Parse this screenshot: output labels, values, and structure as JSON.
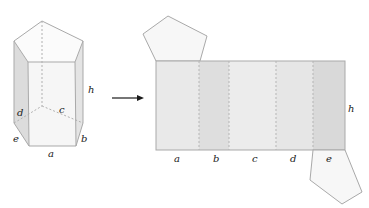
{
  "diagram": {
    "colors": {
      "edge": "#a9a9a9",
      "face_light": "#ececec",
      "face_mid": "#e2e2e2",
      "face_dark": "#d9d9d9",
      "label": "#1a1a1a",
      "arrow": "#1a1a1a"
    },
    "prism": {
      "labels": {
        "a": "a",
        "b": "b",
        "c": "c",
        "d": "d",
        "e": "e",
        "h": "h"
      }
    },
    "net": {
      "labels": {
        "a": "a",
        "b": "b",
        "c": "c",
        "d": "d",
        "e": "e",
        "h": "h"
      }
    }
  }
}
